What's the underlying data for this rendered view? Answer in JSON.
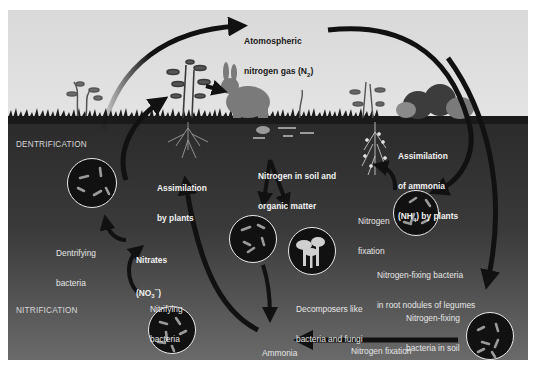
{
  "diagram": {
    "sections": {
      "dentrification": "DENTRIFICATION",
      "nitrification": "NITRIFICATION"
    },
    "labels": {
      "atmospheric_l1": "Atomospheric",
      "atmospheric_l2": "nitrogen gas (N",
      "atmospheric_sub": "2",
      "atmospheric_end": ")",
      "assim_plants_l1": "Assimilation",
      "assim_plants_l2": "by plants",
      "soil_nitrogen_l1": "Nitrogen in soil and",
      "soil_nitrogen_l2": "organic matter",
      "assim_ammonia_l1": "Assimilation",
      "assim_ammonia_l2": "of ammonia",
      "assim_ammonia_l3a": "(NH",
      "assim_ammonia_sub": "4",
      "assim_ammonia_l3b": ") by plants",
      "dentrifying_l1": "Dentrifying",
      "dentrifying_l2": "bacteria",
      "nitrates_l1": "Nitrates",
      "nitrates_l2a": "(NO",
      "nitrates_sub": "3",
      "nitrates_sup": "−",
      "nitrates_l2b": ")",
      "nitrogen_fixation_l1": "Nitrogen",
      "nitrogen_fixation_l2": "fixation",
      "nodules_l1": "Nitrogen-fixing bacteria",
      "nodules_l2": "in root nodules of legumes",
      "decomposers_l1": "Decomposers like",
      "decomposers_l2": "bacteria and fungi",
      "nitrifying_l1": "Nitrifying",
      "nitrifying_l2": "bacteria",
      "ammonia_l1": "Ammonia",
      "ammonia_l2a": "(NH",
      "ammonia_sub": "4",
      "ammonia_l2b": ")",
      "soil_bacteria_l1": "Nitrogen-fixing",
      "soil_bacteria_l2": "bacteria in soil",
      "bottom_fixation": "Nitrogen fixation"
    },
    "colors": {
      "sky": "#dedede",
      "soil_top": "#2b2b2b",
      "soil_bottom": "#6a6a6a",
      "arrow": "#111111",
      "circle_border": "#e9e9e9",
      "bacteria": "#9a9a9a"
    }
  }
}
